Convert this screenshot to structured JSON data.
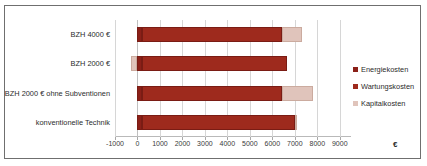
{
  "chart_data": {
    "type": "bar",
    "orientation": "horizontal",
    "stacked": true,
    "title": "",
    "xlabel": "€",
    "ylabel": "",
    "xlim": [
      -1000,
      9500
    ],
    "xticks": [
      "-1000",
      "0",
      "1000",
      "2000",
      "3000",
      "4000",
      "5000",
      "6000",
      "7000",
      "8000",
      "9000"
    ],
    "xtick_values": [
      -1000,
      0,
      1000,
      2000,
      3000,
      4000,
      5000,
      6000,
      7000,
      8000,
      9000
    ],
    "grid": true,
    "legend_position": "right",
    "categories": [
      "BZH 4000 €",
      "BZH 2000 €",
      "BZH 2000 € ohne Subventionen",
      "konventionelle Technik"
    ],
    "series": [
      {
        "name": "Energiekosten",
        "color": "#8B2018",
        "values": [
          200,
          200,
          200,
          200
        ]
      },
      {
        "name": "Wartungskosten",
        "color": "#9e2a1d",
        "values": [
          6250,
          6450,
          6250,
          6800
        ]
      },
      {
        "name": "Kapitalkosten",
        "color": "#e0c4bb",
        "values": [
          850,
          -300,
          1550,
          100
        ]
      }
    ],
    "bar_segments": [
      {
        "category": "BZH 4000 €",
        "start": 0,
        "dark_end": 6450,
        "total_end": 7300
      },
      {
        "category": "BZH 2000 €",
        "start": -300,
        "dark_end": 6650,
        "total_end": 6650
      },
      {
        "category": "BZH 2000 € ohne Subventionen",
        "start": 0,
        "dark_end": 6450,
        "total_end": 7800
      },
      {
        "category": "konventionelle Technik",
        "start": 0,
        "dark_end": 7000,
        "total_end": 7100
      }
    ]
  },
  "legend": {
    "items": [
      {
        "label": "Energiekosten",
        "color": "#8B2018"
      },
      {
        "label": "Wartungskosten",
        "color": "#9e2a1d"
      },
      {
        "label": "Kapitalkosten",
        "color": "#e0c4bb"
      }
    ]
  },
  "axis": {
    "unit_symbol": "€"
  }
}
